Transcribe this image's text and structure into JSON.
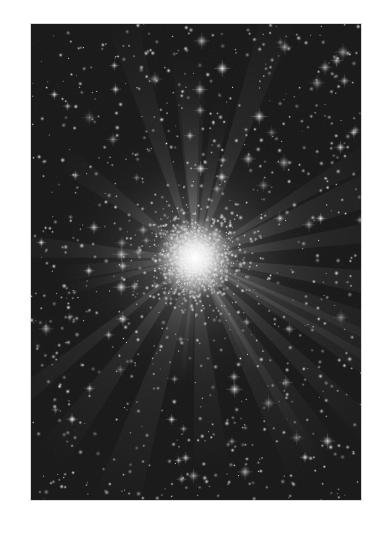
{
  "image": {
    "subject": "globular star cluster",
    "alt": "Grayscale photograph of a dense globular star cluster with a bright core and radiating diffraction rays against a star field",
    "frame": {
      "x": 31,
      "y": 24,
      "width": 330,
      "height": 476
    },
    "core_center": {
      "x": 164,
      "y": 234
    },
    "colors": {
      "page_background": "#ffffff",
      "sky": "#1b1b1b",
      "core": "#ffffff",
      "star": "#e6e6e6"
    },
    "render": {
      "seed": 73,
      "background_stars": 900,
      "cluster_stars": 1400,
      "rays": 26,
      "halo_radius": 150
    }
  }
}
